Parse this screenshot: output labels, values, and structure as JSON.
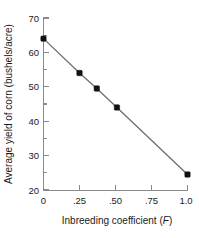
{
  "chart_data": {
    "type": "line",
    "title": "",
    "xlabel": "Inbreeding coefficient (F)",
    "xlabel_main": "Inbreeding coefficient (",
    "xlabel_italic": "F",
    "xlabel_tail": ")",
    "ylabel": "Average yield of corn (bushels/acre)",
    "x": [
      0,
      0.25,
      0.37,
      0.51,
      1.0
    ],
    "values": [
      64,
      54,
      49.5,
      44,
      24.5
    ],
    "series": [
      {
        "name": "Average yield of corn",
        "points": [
          {
            "x": 0,
            "y": 64
          },
          {
            "x": 0.25,
            "y": 54
          },
          {
            "x": 0.37,
            "y": 49.5
          },
          {
            "x": 0.51,
            "y": 44
          },
          {
            "x": 1.0,
            "y": 24.5
          }
        ]
      }
    ],
    "xlim": [
      0,
      1.0
    ],
    "ylim": [
      20,
      70
    ],
    "xticks": [
      0,
      0.25,
      0.5,
      0.75,
      1.0
    ],
    "xticklabels": [
      "0",
      ".25",
      ".50",
      ".75",
      "1.0"
    ],
    "yticks": [
      20,
      30,
      40,
      50,
      60,
      70
    ],
    "yticklabels": [
      "20",
      "30",
      "40",
      "50",
      "60",
      "70"
    ],
    "y_minor_ticks": [
      25,
      35,
      45,
      55,
      65
    ],
    "grid": false,
    "legend": null,
    "marker": "square",
    "marker_color": "#111111",
    "line_color": "#6e6e6e",
    "axis_color": "#8a8a8a",
    "spines": [
      "left",
      "bottom"
    ]
  },
  "axis_labels": {
    "y_tick_20": "20",
    "y_tick_30": "30",
    "y_tick_40": "40",
    "y_tick_50": "50",
    "y_tick_60": "60",
    "y_tick_70": "70",
    "x_tick_0": "0",
    "x_tick_25": ".25",
    "x_tick_50": ".50",
    "x_tick_75": ".75",
    "x_tick_100": "1.0"
  }
}
